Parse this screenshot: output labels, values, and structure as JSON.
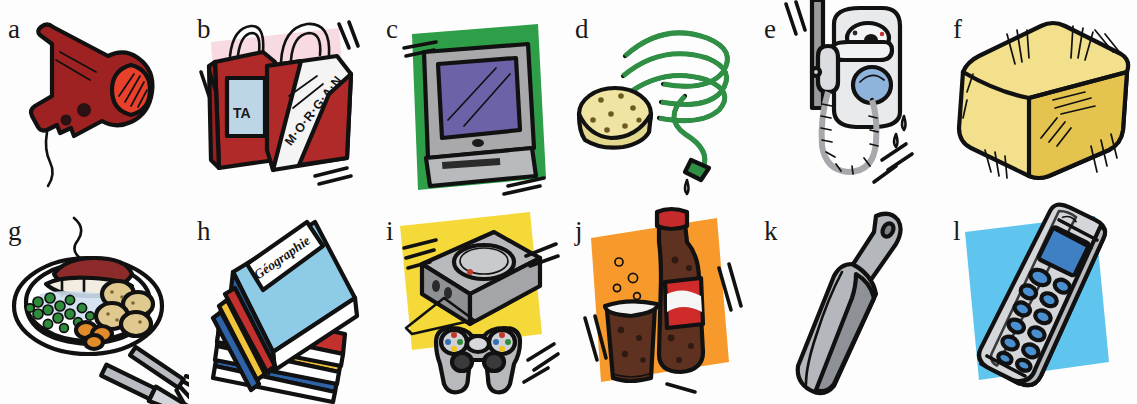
{
  "sheet": {
    "title": "Illustrated vocabulary exercise grid",
    "layout": "6 columns x 2 rows",
    "background_color": "#ffffff",
    "label_color": "#1a1a1a"
  },
  "items": [
    {
      "label": "a",
      "name": "hair-dryer",
      "subject": "hair dryer",
      "colors": {
        "body": "#9e2222",
        "nozzle_ring": "#e8402a",
        "outline": "#111111"
      },
      "backdrop": null,
      "backdrop_color": null,
      "caption_text": null
    },
    {
      "label": "b",
      "name": "shopping-bags",
      "subject": "shopping bags",
      "colors": {
        "bag_red": "#b02a2a",
        "bag_white": "#f4f4f4",
        "panel_blue": "#bcd6e8",
        "outline": "#111111"
      },
      "backdrop": "pink-splash",
      "backdrop_color": "#f7d3dc",
      "caption_text": "M·O·R·G·A·N",
      "secondary_text": "TA"
    },
    {
      "label": "c",
      "name": "television",
      "subject": "television set",
      "colors": {
        "screen": "#6b62a8",
        "frame": "#a9a9ac",
        "outline": "#111111"
      },
      "backdrop": "green-square",
      "backdrop_color": "#2e9e48",
      "caption_text": null
    },
    {
      "label": "d",
      "name": "garden-hose-and-sponge",
      "subject": "garden hose and sponge",
      "colors": {
        "hose": "#2e8f45",
        "sponge": "#f0e4a2",
        "drip": "#5a7fae",
        "outline": "#111111"
      },
      "backdrop": null,
      "backdrop_color": null,
      "caption_text": null
    },
    {
      "label": "e",
      "name": "shower-water-heater",
      "subject": "shower head and water heater",
      "colors": {
        "body": "#e9eaec",
        "button": "#8fb4dc",
        "hose": "#9a9a9d",
        "outline": "#111111"
      },
      "backdrop": null,
      "backdrop_color": null,
      "caption_text": null
    },
    {
      "label": "f",
      "name": "straw-bale",
      "subject": "bale of straw",
      "colors": {
        "top": "#f2e08c",
        "side": "#e4c44e",
        "outline": "#111111"
      },
      "backdrop": null,
      "backdrop_color": null,
      "caption_text": null
    },
    {
      "label": "g",
      "name": "plate-of-food",
      "subject": "plate of food with fork and knife",
      "colors": {
        "plate": "#ffffff",
        "rim": "#3a6ea8",
        "steak": "#8d2b2b",
        "peas": "#2f8c3c",
        "potatoes": "#e0c98f",
        "carrots": "#e28b2a",
        "cutlery": "#b9bcc0",
        "outline": "#111111"
      },
      "backdrop": null,
      "backdrop_color": null,
      "caption_text": null
    },
    {
      "label": "h",
      "name": "stack-of-books",
      "subject": "stack of books",
      "colors": {
        "cover": "#8ecbe6",
        "spine_red": "#c3312f",
        "spine_yellow": "#f2c43a",
        "spine_blue": "#2f63a8",
        "pages": "#ffffff",
        "outline": "#111111"
      },
      "backdrop": null,
      "backdrop_color": null,
      "caption_text": "Géographie"
    },
    {
      "label": "i",
      "name": "game-console",
      "subject": "video game console with controller",
      "colors": {
        "console": "#b7b9bc",
        "console_dark": "#8e9094",
        "outline": "#111111"
      },
      "backdrop": "yellow-square",
      "backdrop_color": "#f5d938",
      "caption_text": null
    },
    {
      "label": "j",
      "name": "cola-bottle-and-glass",
      "subject": "cola bottle and glass",
      "colors": {
        "cola": "#5e3120",
        "label_red": "#cf2b2b",
        "cap": "#c62b2b",
        "glass_rim": "#f2f2f2",
        "outline": "#111111"
      },
      "backdrop": "orange-square",
      "backdrop_color": "#f79a2b",
      "caption_text": null
    },
    {
      "label": "k",
      "name": "scoop-shovel",
      "subject": "scoop",
      "colors": {
        "metal": "#b4b7bb",
        "metal_dark": "#8e9195",
        "outline": "#111111"
      },
      "backdrop": null,
      "backdrop_color": null,
      "caption_text": null
    },
    {
      "label": "l",
      "name": "mobile-phone",
      "subject": "mobile phone",
      "colors": {
        "body": "#d4d6d9",
        "screen": "#3f7fc4",
        "keys": "#4a8fd0",
        "outline": "#111111"
      },
      "backdrop": "blue-square",
      "backdrop_color": "#5fc5ef",
      "caption_text": null
    }
  ]
}
